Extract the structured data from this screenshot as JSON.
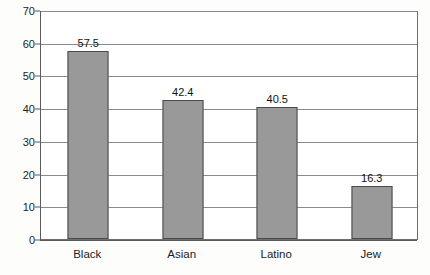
{
  "chart_data": {
    "type": "bar",
    "title": "",
    "subtitle": "",
    "xlabel": "",
    "ylabel": "",
    "categories": [
      "Black",
      "Asian",
      "Latino",
      "Jew"
    ],
    "values": [
      57.5,
      42.4,
      40.5,
      16.3
    ],
    "value_labels": [
      "57.5",
      "42.4",
      "40.5",
      "16.3"
    ],
    "ylim": [
      0,
      70
    ],
    "ytick_labels": [
      "0",
      "10",
      "20",
      "30",
      "40",
      "50",
      "60",
      "70"
    ],
    "ytick_values": [
      0,
      10,
      20,
      30,
      40,
      50,
      60,
      70
    ],
    "grid": "horizontal",
    "legend": "none",
    "series": [
      {
        "name": "",
        "values": [
          57.5,
          42.4,
          40.5,
          16.3
        ],
        "color": "#999999",
        "border_color": "#4a4a4a"
      }
    ]
  },
  "colors": {
    "bar_fill": "#999999",
    "bar_border": "#4a4a4a",
    "gridline": "#8a8a8a",
    "axis": "#5a5a5a",
    "plot_background": "#ffffff",
    "page_background": "#fdfdfc",
    "text": "#1c1c1c"
  }
}
